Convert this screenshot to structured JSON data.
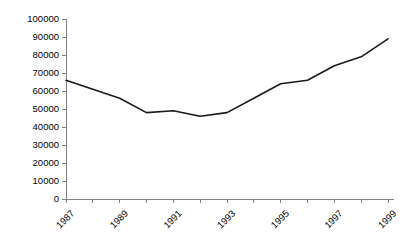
{
  "chart_data": {
    "type": "line",
    "title": "",
    "subtitle": "",
    "xlabel": "",
    "ylabel": "",
    "categories": [
      1987,
      1988,
      1989,
      1990,
      1991,
      1992,
      1993,
      1994,
      1995,
      1996,
      1997,
      1998,
      1999
    ],
    "x": [
      1987,
      1988,
      1989,
      1990,
      1991,
      1992,
      1993,
      1994,
      1995,
      1996,
      1997,
      1998,
      1999
    ],
    "values": [
      66000,
      61000,
      56000,
      48000,
      49000,
      46000,
      48000,
      56000,
      64000,
      66000,
      74000,
      79000,
      89000
    ],
    "series": [
      {
        "name": "",
        "values": [
          66000,
          61000,
          56000,
          48000,
          49000,
          46000,
          48000,
          56000,
          64000,
          66000,
          74000,
          79000,
          89000
        ]
      }
    ],
    "ylim": [
      0,
      100000
    ],
    "xlim": [
      1987,
      1999
    ],
    "ytick_values": [
      0,
      10000,
      20000,
      30000,
      40000,
      50000,
      60000,
      70000,
      80000,
      90000,
      100000
    ],
    "ytick_labels": [
      "0",
      "10000",
      "20000",
      "30000",
      "40000",
      "50000",
      "60000",
      "70000",
      "80000",
      "90000",
      "100000"
    ],
    "xtick_values": [
      1987,
      1988,
      1989,
      1990,
      1991,
      1992,
      1993,
      1994,
      1995,
      1996,
      1997,
      1998,
      1999
    ],
    "xtick_labels": [
      "1987",
      "",
      "1989",
      "",
      "1991",
      "",
      "1993",
      "",
      "1995",
      "",
      "1997",
      "",
      "1999"
    ],
    "xtick_labels_shown": [
      "1987",
      "1989",
      "1991",
      "1993",
      "1995",
      "1997",
      "1999"
    ],
    "xtick_label_rotation": 45,
    "grid": false,
    "legend": false,
    "legend_position": "none",
    "annotations": [],
    "colors": {
      "line": "#1a1a1a",
      "axis": "#808080",
      "text": "#000000",
      "background": "#ffffff"
    }
  }
}
